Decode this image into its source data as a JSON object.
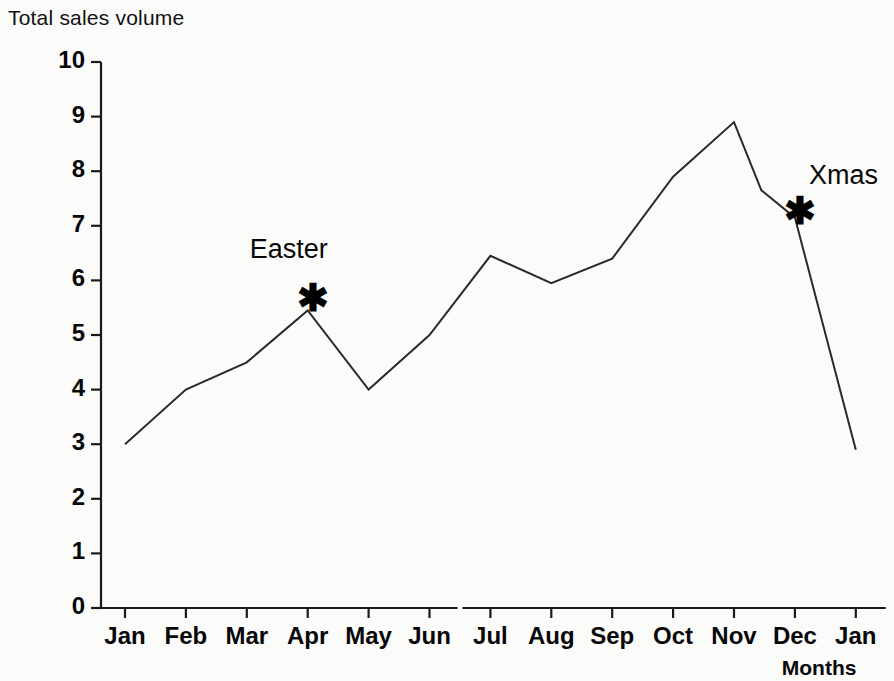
{
  "chart_data": {
    "type": "line",
    "title": "Total sales volume",
    "xlabel": "Months",
    "ylabel": "",
    "xlim": [
      0,
      13
    ],
    "ylim": [
      0,
      10
    ],
    "grid": false,
    "legend": "none",
    "x_tick_labels": [
      "Jan",
      "Feb",
      "Mar",
      "Apr",
      "May",
      "Jun",
      "Jul",
      "Aug",
      "Sep",
      "Oct",
      "Nov",
      "Dec",
      "Jan"
    ],
    "y_tick_labels": [
      "0",
      "1",
      "2",
      "3",
      "4",
      "5",
      "6",
      "7",
      "8",
      "9",
      "10"
    ],
    "y_ticks": [
      0,
      1,
      2,
      3,
      4,
      5,
      6,
      7,
      8,
      9,
      10
    ],
    "categories": [
      "Jan",
      "Feb",
      "Mar",
      "Apr",
      "May",
      "Jun",
      "Jul",
      "Aug",
      "Sep",
      "Oct",
      "Nov",
      "Dec",
      "Jan"
    ],
    "values": [
      3.0,
      4.0,
      4.5,
      5.45,
      4.0,
      5.0,
      6.45,
      5.95,
      6.4,
      7.9,
      8.9,
      7.15,
      2.9
    ],
    "intermediate_points": [
      {
        "after": "Nov",
        "x_fraction": 0.45,
        "value": 7.65
      }
    ],
    "axis_break": {
      "between": [
        "Jun",
        "Jul"
      ],
      "present": true
    },
    "annotations": [
      {
        "label": "Easter",
        "marker": "*",
        "at_category": "Apr",
        "value": 5.45
      },
      {
        "label": "Xmas",
        "marker": "*",
        "at_category": "Dec",
        "value": 7.15
      }
    ]
  },
  "title": "Total sales volume",
  "axis": {
    "x_caption": "Months"
  },
  "annotations": {
    "easter": "Easter",
    "xmas": "Xmas",
    "marker": "✱"
  },
  "colors": {
    "line": "#2a2a2a",
    "axis": "#1a1a1a",
    "text": "#080808",
    "background": "#fbfbfa"
  }
}
